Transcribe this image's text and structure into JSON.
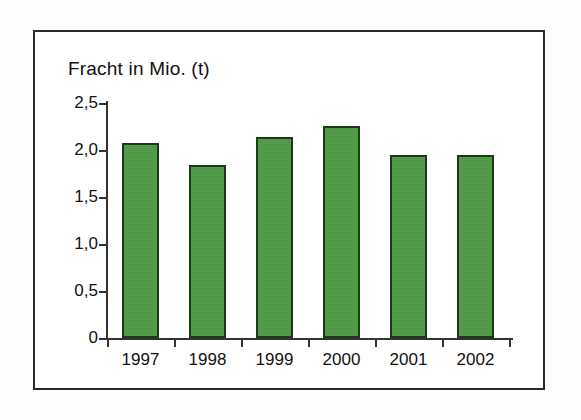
{
  "chart_data": {
    "type": "bar",
    "title": "Fracht in Mio. (t)",
    "subtitle": "",
    "xlabel": "",
    "ylabel": "Fracht in Mio. (t)",
    "categories": [
      "1997",
      "1998",
      "1999",
      "2000",
      "2001",
      "2002"
    ],
    "values": [
      2.07,
      1.84,
      2.14,
      2.25,
      1.95,
      1.95
    ],
    "series": [
      {
        "name": "Fracht in Mio. (t)",
        "values": [
          2.07,
          1.84,
          2.14,
          2.25,
          1.95,
          1.95
        ]
      }
    ],
    "ylim": [
      0,
      2.5
    ],
    "ytick_values": [
      0,
      0.5,
      1.0,
      1.5,
      2.0,
      2.5
    ],
    "ytick_labels": [
      "0",
      "0,5",
      "1,0",
      "1,5",
      "2,0",
      "2,5"
    ],
    "xtick_labels": [
      "1997",
      "1998",
      "1999",
      "2000",
      "2001",
      "2002"
    ],
    "grid": false,
    "legend": false,
    "legend_position": "none",
    "bar_color": "#4e9a45",
    "bar_border_color": "#1c3a18",
    "axis_color": "#333333",
    "frame_color": "#2b2b2b",
    "background_color": "#ffffff",
    "decimal_separator": ","
  }
}
